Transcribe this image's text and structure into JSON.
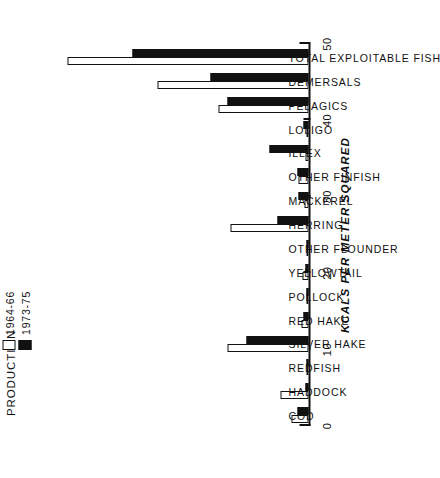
{
  "chart_data": {
    "type": "bar",
    "title": "PRODUCTION",
    "xlabel": "",
    "ylabel": "KCALS PER METER SQUARED",
    "orientation": "rotated-90",
    "grid": false,
    "legend_position": "top-left",
    "ylim": [
      0,
      50
    ],
    "yticks": [
      0,
      10,
      20,
      30,
      40,
      50
    ],
    "ytick_labels": [
      "0",
      "10",
      "20",
      "30",
      "40",
      "50"
    ],
    "categories": [
      "COD",
      "HADDOCK",
      "REDFISH",
      "SILVER HAKE",
      "RED HAKE",
      "POLLOCK",
      "YELLOWTAIL",
      "OTHER FLOUNDER",
      "HERRING",
      "MACKEREL",
      "OTHER FINFISH",
      "ILLEX",
      "LOLIGO",
      "PELAGICS",
      "DEMERSALS",
      "TOTAL EXPLOITABLE FISH"
    ],
    "series": [
      {
        "name": "1964-66",
        "color": "#ffffff",
        "values": [
          3.0,
          5.0,
          0.4,
          14.5,
          1.2,
          0.3,
          1.0,
          0.4,
          14.0,
          0.8,
          1.8,
          0.5,
          0.2,
          16.0,
          27.0,
          43.0
        ]
      },
      {
        "name": "1973-75",
        "color": "#111111",
        "values": [
          2.0,
          0.5,
          0.4,
          11.0,
          0.9,
          0.2,
          0.5,
          0.2,
          5.5,
          1.8,
          2.0,
          7.0,
          0.9,
          14.5,
          17.5,
          31.5
        ]
      }
    ]
  },
  "legend": {
    "entries": [
      {
        "label": "1964-66",
        "swatch": "white"
      },
      {
        "label": "1973-75",
        "swatch": "black"
      }
    ]
  }
}
